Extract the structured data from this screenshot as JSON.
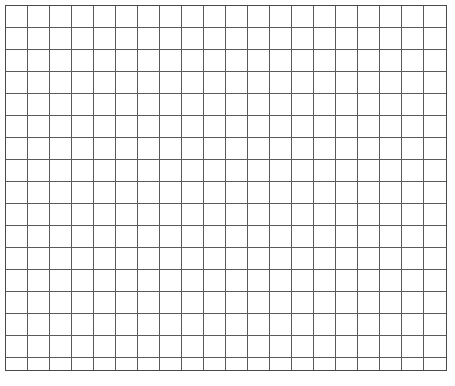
{
  "document": {
    "title": "Blank Grid Sheet",
    "type": "graph-paper",
    "background_color": "#ffffff"
  },
  "grid": {
    "columns": 20,
    "rows": 17,
    "cell_width": 22,
    "cell_height": 22,
    "origin_x": 5,
    "origin_y": 5,
    "width": 442,
    "height": 366,
    "line_color": "#5a5a5a",
    "border_color": "#4a4a4a",
    "line_width": 1,
    "fill_color": "#ffffff",
    "cell_contents": []
  },
  "canvas": {
    "width": 455,
    "height": 386,
    "margin_color": "#ffffff"
  }
}
